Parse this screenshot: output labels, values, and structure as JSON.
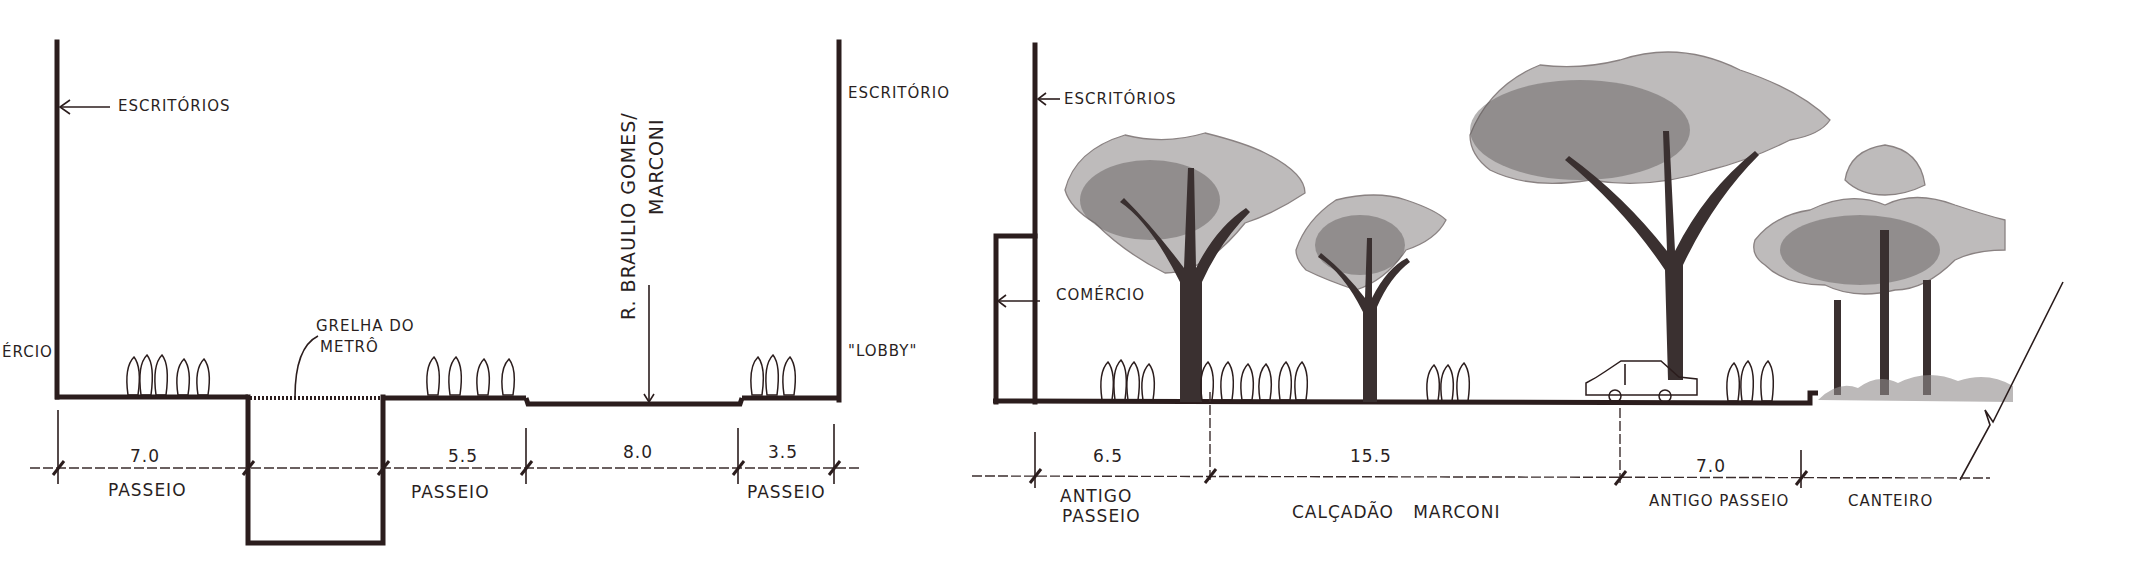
{
  "figure": {
    "left_section": {
      "title": "Corte existente",
      "labels": {
        "offices_left": "ESCRITÓRIOS",
        "commerce_left": "ÉRCIO",
        "metro_grate": "GRELHA DO METRÔ",
        "metro_grate_line1": "GRELHA DO",
        "metro_grate_line2": "METRÔ",
        "street_name_line1": "R. BRAULIO GOMES/",
        "street_name_line2": "MARCONI",
        "offices_right": "ESCRITÓRIO",
        "lobby": "\"LOBBY\""
      },
      "dimensions": [
        {
          "value": "7.0",
          "label": "PASSEIO"
        },
        {
          "value": "5.5",
          "label": "PASSEIO"
        },
        {
          "value": "8.0",
          "label": ""
        },
        {
          "value": "3.5",
          "label": "PASSEIO"
        }
      ]
    },
    "right_section": {
      "title": "Corte proposto",
      "labels": {
        "offices": "ESCRITÓRIOS",
        "commerce": "COMÉRCIO"
      },
      "dimensions": [
        {
          "value": "6.5",
          "label_line1": "ANTIGO",
          "label_line2": "PASSEIO"
        },
        {
          "value": "15.5",
          "label_line1": "CALÇADÃO   MARCONI",
          "label_line2": ""
        },
        {
          "value": "7.0",
          "label_line1": "ANTIGO PASSEIO",
          "label_line2": ""
        },
        {
          "value": "",
          "label_line1": "CANTEIRO",
          "label_line2": ""
        }
      ]
    },
    "colors": {
      "ink": "#2b1d1d",
      "shading": "#8a8585",
      "paper": "#ffffff"
    }
  }
}
